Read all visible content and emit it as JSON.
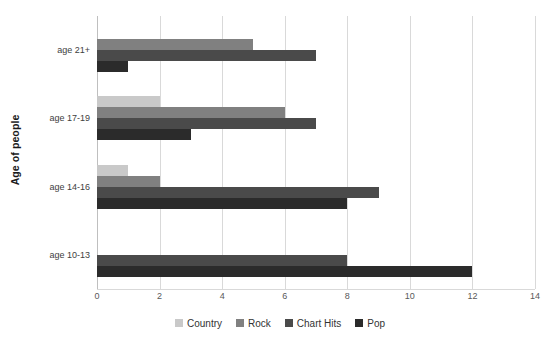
{
  "chart_data": {
    "type": "bar",
    "orientation": "horizontal",
    "title": "",
    "xlabel": "",
    "ylabel": "Age of people",
    "categories": [
      "age 21+",
      "age 17-19",
      "age 14-16",
      "age 10-13"
    ],
    "series": [
      {
        "name": "Country",
        "color": "#c9c9c9",
        "values": [
          0,
          2,
          1,
          0
        ]
      },
      {
        "name": "Rock",
        "color": "#808080",
        "values": [
          5,
          6,
          2,
          0
        ]
      },
      {
        "name": "Chart Hits",
        "color": "#4a4a4a",
        "values": [
          7,
          7,
          9,
          8
        ]
      },
      {
        "name": "Pop",
        "color": "#2b2b2b",
        "values": [
          1,
          3,
          8,
          12
        ]
      }
    ],
    "xlim": [
      0,
      14
    ],
    "xticks": [
      0,
      2,
      4,
      6,
      8,
      10,
      12,
      14
    ],
    "xtick_labels": [
      "0",
      "2",
      "4",
      "6",
      "8",
      "10",
      "12",
      "14"
    ],
    "grid": true,
    "grid_axis": "x",
    "legend_position": "bottom",
    "legend_entries": [
      "Country",
      "Rock",
      "Chart Hits",
      "Pop"
    ],
    "background_color": "#ffffff",
    "gridline_color": "#d9d9d9"
  }
}
